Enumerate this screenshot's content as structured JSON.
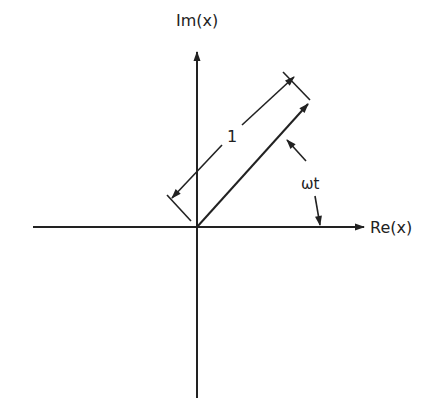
{
  "diagram": {
    "axes": {
      "horizontal_label": "Re(x)",
      "vertical_label": "Im(x)"
    },
    "phasor": {
      "magnitude_label": "1",
      "angle_label": "ωt"
    },
    "colors": {
      "ink": "#222222",
      "background": "#ffffff"
    }
  }
}
